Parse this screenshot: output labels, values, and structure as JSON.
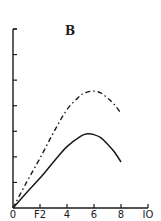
{
  "chart_data": {
    "type": "line",
    "title": "B",
    "xlabel": "",
    "ylabel": "",
    "xlim": [
      0,
      10
    ],
    "ylim": [
      0,
      7
    ],
    "x_ticks": [
      {
        "value": 0,
        "label": "0"
      },
      {
        "value": 2,
        "label": "F2"
      },
      {
        "value": 4,
        "label": "4"
      },
      {
        "value": 6,
        "label": "6"
      },
      {
        "value": 8,
        "label": "8"
      },
      {
        "value": 10,
        "label": "IO"
      }
    ],
    "y_ticks": [
      1,
      2,
      3,
      4,
      5,
      6,
      7
    ],
    "y_tick_labels_shown": false,
    "grid": false,
    "legend": "none",
    "series": [
      {
        "name": "dash-dot curve",
        "style": "dash-dot",
        "x": [
          0,
          1,
          2,
          3,
          4,
          5,
          5.5,
          6,
          6.5,
          7,
          7.5,
          8
        ],
        "y": [
          0,
          1.0,
          1.95,
          2.95,
          3.85,
          4.4,
          4.53,
          4.57,
          4.5,
          4.3,
          4.05,
          3.7
        ]
      },
      {
        "name": "solid curve",
        "style": "solid",
        "x": [
          0,
          1,
          2,
          3,
          4,
          5,
          5.5,
          6,
          6.5,
          7,
          7.5,
          8
        ],
        "y": [
          0,
          0.6,
          1.17,
          1.8,
          2.4,
          2.8,
          2.9,
          2.87,
          2.75,
          2.5,
          2.2,
          1.8
        ]
      }
    ]
  }
}
